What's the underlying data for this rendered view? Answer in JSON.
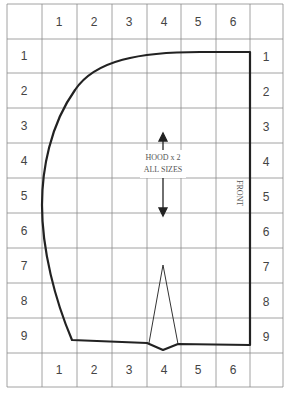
{
  "diagram": {
    "annotation_line1": "HOOD x 2",
    "annotation_line2": "ALL SIZES",
    "side_label": "FRONT",
    "column_labels_top": [
      "1",
      "2",
      "3",
      "4",
      "5",
      "6"
    ],
    "column_labels_bottom": [
      "1",
      "2",
      "3",
      "4",
      "5",
      "6"
    ],
    "row_labels_left": [
      "1",
      "2",
      "3",
      "4",
      "5",
      "6",
      "7",
      "8",
      "9"
    ],
    "row_labels_right": [
      "1",
      "2",
      "3",
      "4",
      "5",
      "6",
      "7",
      "8",
      "9"
    ],
    "colors": {
      "grid": "#8a8a8a",
      "outline": "#222222",
      "text": "#444444"
    }
  }
}
